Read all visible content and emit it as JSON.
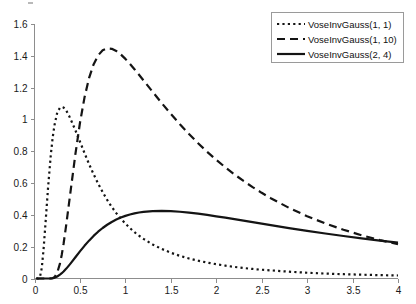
{
  "chart_data": {
    "type": "line",
    "title": "",
    "subtitle": "",
    "xlabel": "",
    "ylabel": "",
    "xlim": [
      0,
      4
    ],
    "ylim": [
      0,
      1.6
    ],
    "grid": false,
    "legend_position": "top-right",
    "x_ticks": [
      "0",
      "0.5",
      "1",
      "1.5",
      "2",
      "2.5",
      "3",
      "3.5",
      "4"
    ],
    "x_tick_values": [
      0,
      0.5,
      1,
      1.5,
      2,
      2.5,
      3,
      3.5,
      4
    ],
    "y_ticks": [
      "0",
      "0.2",
      "0.4",
      "0.6",
      "0.8",
      "1",
      "1.2",
      "1.4",
      "1.6"
    ],
    "y_tick_values": [
      0,
      0.2,
      0.4,
      0.6,
      0.8,
      1,
      1.2,
      1.4,
      1.6
    ],
    "x": [
      0.02,
      0.04,
      0.06,
      0.08,
      0.1,
      0.12,
      0.15,
      0.18,
      0.2,
      0.22,
      0.25,
      0.28,
      0.3,
      0.32,
      0.35,
      0.38,
      0.4,
      0.45,
      0.5,
      0.55,
      0.6,
      0.65,
      0.7,
      0.75,
      0.8,
      0.85,
      0.9,
      0.95,
      1.0,
      1.05,
      1.1,
      1.15,
      1.2,
      1.3,
      1.4,
      1.5,
      1.6,
      1.7,
      1.8,
      1.9,
      2.0,
      2.1,
      2.2,
      2.3,
      2.4,
      2.5,
      2.6,
      2.8,
      3.0,
      3.2,
      3.4,
      3.6,
      3.8,
      4.0
    ],
    "series": [
      {
        "name": "VoseInvGauss(1, 1)",
        "style": "dotted",
        "peak_x": 0.3,
        "peak_y": 1.08,
        "values": [
          0.0,
          0.0001,
          0.009,
          0.066,
          0.186,
          0.339,
          0.578,
          0.781,
          0.886,
          0.964,
          1.043,
          1.074,
          1.079,
          1.075,
          1.055,
          1.023,
          0.998,
          0.932,
          0.861,
          0.789,
          0.72,
          0.656,
          0.597,
          0.543,
          0.494,
          0.45,
          0.411,
          0.376,
          0.345,
          0.317,
          0.291,
          0.269,
          0.249,
          0.214,
          0.186,
          0.162,
          0.142,
          0.126,
          0.112,
          0.1,
          0.09,
          0.081,
          0.073,
          0.066,
          0.06,
          0.055,
          0.051,
          0.043,
          0.036,
          0.031,
          0.027,
          0.024,
          0.021,
          0.019
        ]
      },
      {
        "name": "VoseInvGauss(1, 10)",
        "style": "dashed",
        "peak_x": 0.86,
        "peak_y": 1.42,
        "values": [
          0.0,
          0.0,
          0.0,
          0.0,
          0.0,
          0.0,
          0.0,
          0.0002,
          0.0017,
          0.0078,
          0.036,
          0.0936,
          0.1498,
          0.2184,
          0.3413,
          0.4733,
          0.5621,
          0.7813,
          0.9775,
          1.1375,
          1.2593,
          1.3461,
          1.4027,
          1.4346,
          1.4469,
          1.4442,
          1.4303,
          1.4083,
          1.3807,
          1.3494,
          1.3157,
          1.2807,
          1.2452,
          1.1736,
          1.1028,
          1.0346,
          0.9696,
          0.9083,
          0.8506,
          0.7966,
          0.746,
          0.6987,
          0.6545,
          0.6132,
          0.5747,
          0.5387,
          0.505,
          0.4443,
          0.3917,
          0.3461,
          0.3064,
          0.2718,
          0.2416,
          0.2151
        ]
      },
      {
        "name": "VoseInvGauss(2, 4)",
        "style": "solid",
        "peak_x": 1.05,
        "peak_y": 0.483,
        "values": [
          0.0,
          0.0,
          0.0,
          0.0,
          0.0,
          0.0,
          0.0001,
          0.0009,
          0.0025,
          0.0054,
          0.0128,
          0.0242,
          0.0333,
          0.0438,
          0.0622,
          0.0827,
          0.0969,
          0.1336,
          0.1703,
          0.2054,
          0.238,
          0.2676,
          0.2941,
          0.3175,
          0.3379,
          0.3555,
          0.3705,
          0.3831,
          0.3937,
          0.4023,
          0.4093,
          0.4148,
          0.419,
          0.4239,
          0.4252,
          0.4236,
          0.4198,
          0.4142,
          0.4074,
          0.3996,
          0.3911,
          0.3822,
          0.373,
          0.3636,
          0.3541,
          0.3447,
          0.3353,
          0.317,
          0.2996,
          0.283,
          0.2673,
          0.2525,
          0.2386,
          0.2255
        ]
      }
    ]
  },
  "legend": {
    "entries": [
      {
        "label": "VoseInvGauss(1, 1)",
        "style": "dotted"
      },
      {
        "label": "VoseInvGauss(1, 10)",
        "style": "dashed"
      },
      {
        "label": "VoseInvGauss(2, 4)",
        "style": "solid"
      }
    ]
  },
  "axes": {
    "y_labels": [
      "1.6",
      "1.4",
      "1.2",
      "1",
      "0.8",
      "0.6",
      "0.4",
      "0.2",
      "0"
    ],
    "x_labels": [
      "0",
      "0.5",
      "1",
      "1.5",
      "2",
      "2.5",
      "3",
      "3.5",
      "4"
    ]
  },
  "colors": {
    "curve": "#141414",
    "axis": "#8d8d8d",
    "text": "#1a1a1a",
    "background": "#ffffff",
    "legend_border": "#9a9a9a"
  }
}
